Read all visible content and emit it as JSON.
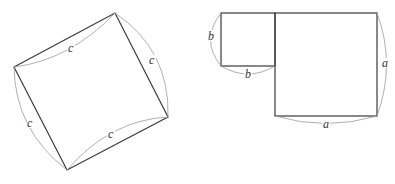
{
  "figure": {
    "left_diagram": {
      "description": "Tilted square with side c",
      "shape": "square",
      "side_labels": [
        "c",
        "c",
        "c",
        "c"
      ]
    },
    "right_diagram": {
      "description": "Small square of side b adjacent to large square of side a",
      "small_square": {
        "side_labels": [
          "b",
          "b"
        ]
      },
      "large_square": {
        "side_labels": [
          "a",
          "a"
        ]
      }
    }
  },
  "labels": {
    "c_top": "c",
    "c_right": "c",
    "c_left": "c",
    "c_bottom": "c",
    "b_left": "b",
    "b_bottom": "b",
    "a_right": "a",
    "a_bottom": "a"
  },
  "colors": {
    "edge": "#3a3a3a",
    "brace": "#9a9a9a",
    "background": "#ffffff"
  }
}
